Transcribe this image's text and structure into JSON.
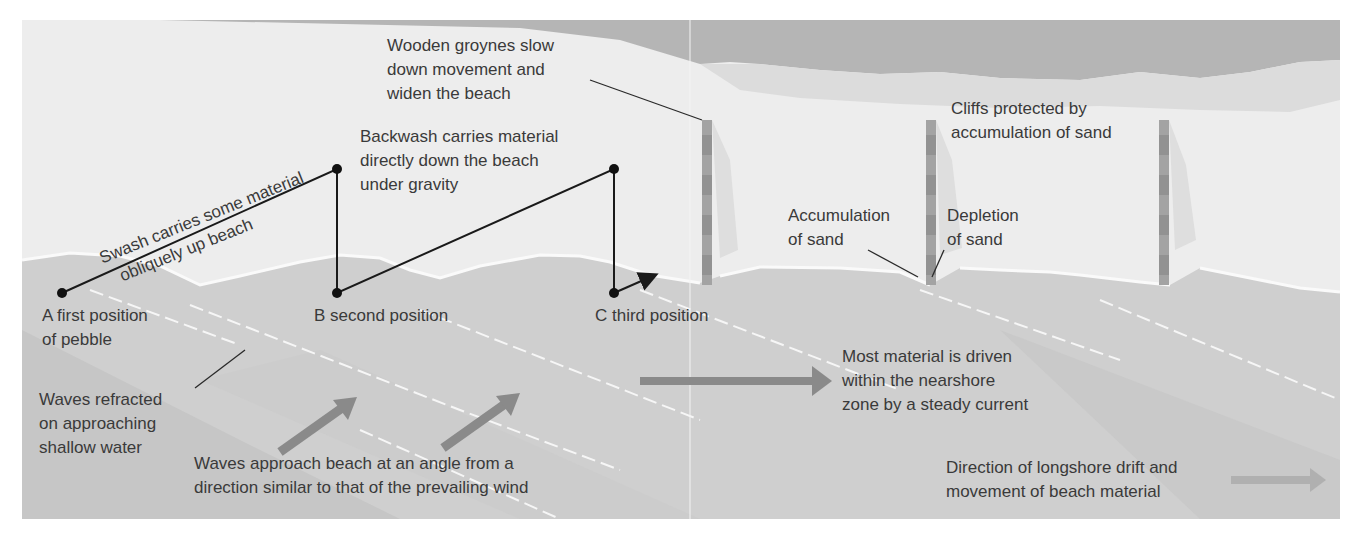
{
  "diagram": {
    "title": "Longshore drift",
    "colors": {
      "sea_far": "#b3b3b3",
      "cliff_top": "#d2d2d2",
      "beach": "#ececec",
      "water": "#cdcdcd",
      "water_dark": "#c2c2c2",
      "arrow": "#8a8a8a",
      "arrow_light": "#b0b0b0",
      "line": "#1a1a1a",
      "groyne": "#9d9d9d"
    },
    "labels": {
      "groynes": [
        "Wooden groynes slow",
        "down movement and",
        "widen the beach"
      ],
      "cliffs": [
        "Cliffs protected by",
        "accumulation of sand"
      ],
      "swash": [
        "Swash carries some material",
        "obliquely up beach"
      ],
      "backwash": [
        "Backwash carries material",
        "directly down the beach",
        "under gravity"
      ],
      "accumulation": [
        "Accumulation",
        "of sand"
      ],
      "depletion": [
        "Depletion",
        "of sand"
      ],
      "point_a": [
        "A  first position",
        "of pebble"
      ],
      "point_b": "B  second position",
      "point_c": "C  third position",
      "refracted": [
        "Waves refracted",
        "on approaching",
        "shallow water"
      ],
      "approach": [
        "Waves approach beach at an angle from a",
        "direction similar to that of the prevailing wind"
      ],
      "nearshore": [
        "Most material is driven",
        "within the nearshore",
        "zone by a steady current"
      ],
      "legend": [
        "Direction of longshore drift and",
        "movement of beach material"
      ]
    },
    "points": [
      {
        "id": "A",
        "x": 62,
        "y": 293
      },
      {
        "id": "apex1",
        "x": 337,
        "y": 169
      },
      {
        "id": "B",
        "x": 337,
        "y": 293
      },
      {
        "id": "apex2",
        "x": 614,
        "y": 169
      },
      {
        "id": "C",
        "x": 614,
        "y": 293
      }
    ],
    "groynes": [
      {
        "x": 706,
        "top": 120,
        "bottom": 285
      },
      {
        "x": 930,
        "top": 120,
        "bottom": 285
      },
      {
        "x": 1163,
        "top": 120,
        "bottom": 285
      }
    ]
  }
}
